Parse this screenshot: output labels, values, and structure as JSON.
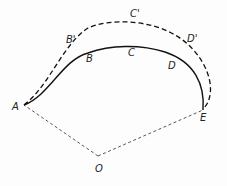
{
  "diagram": {
    "points": {
      "A": {
        "label": "A",
        "x": 24,
        "y": 105,
        "label_x": 12,
        "label_y": 110
      },
      "B": {
        "label": "B",
        "x": 85,
        "y": 54,
        "label_x": 86,
        "label_y": 62
      },
      "C": {
        "label": "C",
        "x": 130,
        "y": 45,
        "label_x": 128,
        "label_y": 56
      },
      "D": {
        "label": "D",
        "x": 178,
        "y": 60,
        "label_x": 168,
        "label_y": 69
      },
      "E": {
        "label": "E",
        "x": 203,
        "y": 110,
        "label_x": 200,
        "label_y": 121
      },
      "B_prime": {
        "label": "B'",
        "x": 82,
        "y": 30,
        "label_x": 66,
        "label_y": 43
      },
      "C_prime": {
        "label": "C'",
        "x": 130,
        "y": 22,
        "label_x": 130,
        "label_y": 17
      },
      "D_prime": {
        "label": "D'",
        "x": 190,
        "y": 45,
        "label_x": 187,
        "label_y": 42
      },
      "O": {
        "label": "O",
        "x": 98,
        "y": 156,
        "label_x": 95,
        "label_y": 172
      }
    },
    "curves": {
      "solid_path": "M24,105 C50,95 62,60 88,53 C110,45 140,44 165,52 C195,62 205,85 203,110",
      "dashed_path": "M24,105 C50,85 62,45 88,28 C110,18 150,20 175,35 C205,52 220,90 204,108"
    },
    "radii": {
      "OA": "M98,156 L24,105",
      "OE": "M98,156 L203,110"
    },
    "colors": {
      "stroke": "#111111",
      "radius_stroke": "#444444"
    }
  }
}
